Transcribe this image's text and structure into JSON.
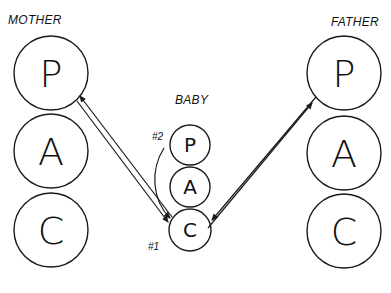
{
  "diagram": {
    "mother": {
      "label": "MOTHER",
      "states": [
        {
          "letter": "P",
          "cx": 51,
          "cy": 73,
          "r": 37
        },
        {
          "letter": "A",
          "cx": 51,
          "cy": 151,
          "r": 37
        },
        {
          "letter": "C",
          "cx": 51,
          "cy": 230,
          "r": 37
        }
      ]
    },
    "baby": {
      "label": "BABY",
      "states": [
        {
          "letter": "P",
          "cx": 190,
          "cy": 145,
          "r": 20
        },
        {
          "letter": "A",
          "cx": 190,
          "cy": 187,
          "r": 20
        },
        {
          "letter": "C",
          "cx": 190,
          "cy": 230,
          "r": 21
        }
      ],
      "annotations": [
        {
          "text": "#2",
          "x": 163,
          "y": 140
        },
        {
          "text": "#1",
          "x": 159,
          "y": 248
        }
      ]
    },
    "father": {
      "label": "FATHER",
      "states": [
        {
          "letter": "P",
          "cx": 344,
          "cy": 73,
          "r": 37
        },
        {
          "letter": "A",
          "cx": 344,
          "cy": 153,
          "r": 37
        },
        {
          "letter": "C",
          "cx": 344,
          "cy": 231,
          "r": 37
        }
      ]
    },
    "colors": {
      "stroke": "#1a1a1a",
      "background": "#ffffff"
    }
  }
}
